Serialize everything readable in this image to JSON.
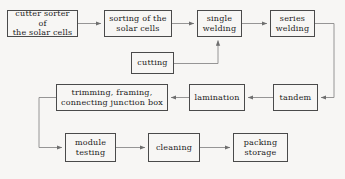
{
  "diagram": {
    "background_color": "#f7f6f4",
    "box_border_color": "#4a4a4a",
    "edge_color": "#8a8a8a",
    "text_color": "#1b1b1b"
  },
  "nodes": [
    {
      "id": "cutter-sorter",
      "label": "cutter sorter of\nthe solar cells",
      "x": 7,
      "y": 10,
      "w": 71,
      "h": 27,
      "row": "top"
    },
    {
      "id": "sorting",
      "label": "sorting of the\nsolar cells",
      "x": 104,
      "y": 10,
      "w": 68,
      "h": 27,
      "row": "top"
    },
    {
      "id": "single-welding",
      "label": "single\nwelding",
      "x": 197,
      "y": 10,
      "w": 45,
      "h": 27,
      "row": "top"
    },
    {
      "id": "series-welding",
      "label": "series\nwelding",
      "x": 270,
      "y": 10,
      "w": 45,
      "h": 27,
      "row": "top"
    },
    {
      "id": "cutting",
      "label": "cutting",
      "x": 131,
      "y": 52,
      "w": 43,
      "h": 22,
      "row": "feeder"
    },
    {
      "id": "trimming",
      "label": "trimming, framing,\nconnecting junction box",
      "x": 56,
      "y": 84,
      "w": 112,
      "h": 27,
      "row": "middle"
    },
    {
      "id": "lamination",
      "label": "lamination",
      "x": 189,
      "y": 84,
      "w": 56,
      "h": 27,
      "row": "middle"
    },
    {
      "id": "tandem",
      "label": "tandem",
      "x": 273,
      "y": 84,
      "w": 45,
      "h": 27,
      "row": "middle"
    },
    {
      "id": "module-testing",
      "label": "module\ntesting",
      "x": 65,
      "y": 133,
      "w": 51,
      "h": 29,
      "row": "bottom"
    },
    {
      "id": "cleaning",
      "label": "cleaning",
      "x": 148,
      "y": 133,
      "w": 52,
      "h": 29,
      "row": "bottom"
    },
    {
      "id": "packing",
      "label": "packing\nstorage",
      "x": 233,
      "y": 133,
      "w": 55,
      "h": 29,
      "row": "bottom"
    }
  ],
  "edges": [
    {
      "id": "e1",
      "from": "cutter-sorter",
      "to": "sorting",
      "kind": "straight-right"
    },
    {
      "id": "e2",
      "from": "sorting",
      "to": "single-welding",
      "kind": "straight-right"
    },
    {
      "id": "e3",
      "from": "single-welding",
      "to": "series-welding",
      "kind": "straight-right"
    },
    {
      "id": "e4",
      "from": "series-welding",
      "to": "tandem",
      "kind": "right-loop-down"
    },
    {
      "id": "e5",
      "from": "tandem",
      "to": "lamination",
      "kind": "straight-left"
    },
    {
      "id": "e6",
      "from": "lamination",
      "to": "trimming",
      "kind": "straight-left"
    },
    {
      "id": "e7",
      "from": "cutting",
      "to": "single-welding",
      "kind": "right-then-up"
    },
    {
      "id": "e8",
      "from": "trimming",
      "to": "module-testing",
      "kind": "left-loop-down"
    },
    {
      "id": "e9",
      "from": "module-testing",
      "to": "cleaning",
      "kind": "straight-right"
    },
    {
      "id": "e10",
      "from": "cleaning",
      "to": "packing",
      "kind": "straight-right"
    }
  ]
}
